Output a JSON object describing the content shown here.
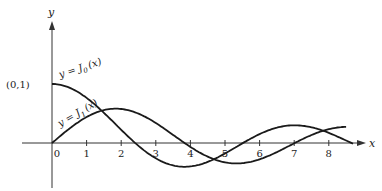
{
  "chart_data": {
    "type": "line",
    "title": "",
    "xlabel": "x",
    "ylabel": "y",
    "xlim": [
      0,
      8.8
    ],
    "ylim": [
      -0.45,
      1.05
    ],
    "x_ticks": [
      "0",
      "1",
      "2",
      "3",
      "4",
      "5",
      "6",
      "7",
      "8"
    ],
    "point_annotation": "(0,1)",
    "grid": false,
    "series": [
      {
        "name": "y = J0(x)",
        "label_main": "y = J",
        "label_sub": "0",
        "label_arg": "(x)",
        "function": "bessel_J0",
        "x_range": [
          0,
          8.7
        ]
      },
      {
        "name": "y = J1(x)",
        "label_main": "y = J",
        "label_sub": "1",
        "label_arg": "(x)",
        "function": "bessel_J1",
        "x_range": [
          0,
          8.5
        ]
      }
    ],
    "color": "#1a1a1a"
  }
}
